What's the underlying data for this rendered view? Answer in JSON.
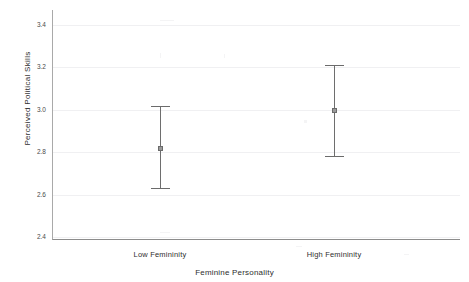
{
  "chart_data": {
    "type": "scatter",
    "title": "",
    "subtitle": "",
    "xlabel": "Feminine Personality",
    "ylabel": "Perceived Political Skills",
    "categories": [
      "Low Femininity",
      "High Femininity"
    ],
    "values": [
      2.82,
      3.0
    ],
    "error_low": [
      2.63,
      2.78
    ],
    "error_high": [
      3.02,
      3.21
    ],
    "series": [
      {
        "name": "Perceived Political Skills",
        "values": [
          2.82,
          3.0
        ],
        "error_low": [
          2.63,
          2.78
        ],
        "error_high": [
          3.02,
          3.21
        ]
      }
    ],
    "ylim": [
      2.4,
      3.4
    ],
    "yticks": [
      "2.4",
      "2.6",
      "2.8",
      "3.0",
      "3.2",
      "3.4"
    ],
    "ytick_values": [
      2.4,
      2.6,
      2.8,
      3.0,
      3.2,
      3.4
    ],
    "xticks": [
      "Low Femininity",
      "High Femininity"
    ],
    "grid": true,
    "grid_axis": "y",
    "legend": false,
    "legend_position": "none",
    "marker": "circle-with-error-bars",
    "colors": {
      "marker": "#9a9a9a",
      "error_bar": "#6b6b6b",
      "gridline": "#f0f0f2",
      "axis": "#8c8c8c",
      "background": "#ffffff",
      "text": "#2e2e2e"
    }
  }
}
